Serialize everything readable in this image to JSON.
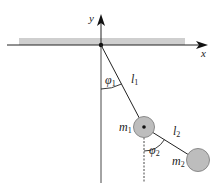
{
  "diagram": {
    "axes": {
      "x_label": "x",
      "y_label": "y"
    },
    "labels": {
      "phi1": "φ",
      "phi1_sub": "1",
      "l1": "l",
      "l1_sub": "1",
      "m1": "m",
      "m1_sub": "1",
      "phi2": "φ",
      "phi2_sub": "2",
      "l2": "l",
      "l2_sub": "2",
      "m2": "m",
      "m2_sub": "2"
    },
    "colors": {
      "ceiling": "#c8c8c8",
      "mass_fill": "#bdbdbd",
      "mass_stroke": "#888888",
      "line": "#222222"
    }
  }
}
